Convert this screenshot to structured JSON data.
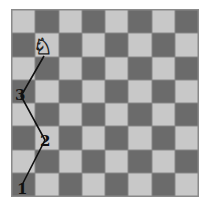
{
  "diagram": {
    "type": "chessboard-knight-path",
    "board": {
      "rows": 8,
      "cols": 8,
      "top_left": "light"
    },
    "colors": {
      "light": "#c8c8c8",
      "dark": "#6b6b6b",
      "line": "#111111"
    },
    "piece": {
      "name": "knight",
      "glyph": "♘",
      "square": [
        1,
        1
      ]
    },
    "path_labels": [
      {
        "text": "3",
        "square": [
          0,
          3
        ]
      },
      {
        "text": "2",
        "square": [
          1,
          5
        ]
      },
      {
        "text": "1",
        "square": [
          0,
          7
        ]
      }
    ]
  }
}
